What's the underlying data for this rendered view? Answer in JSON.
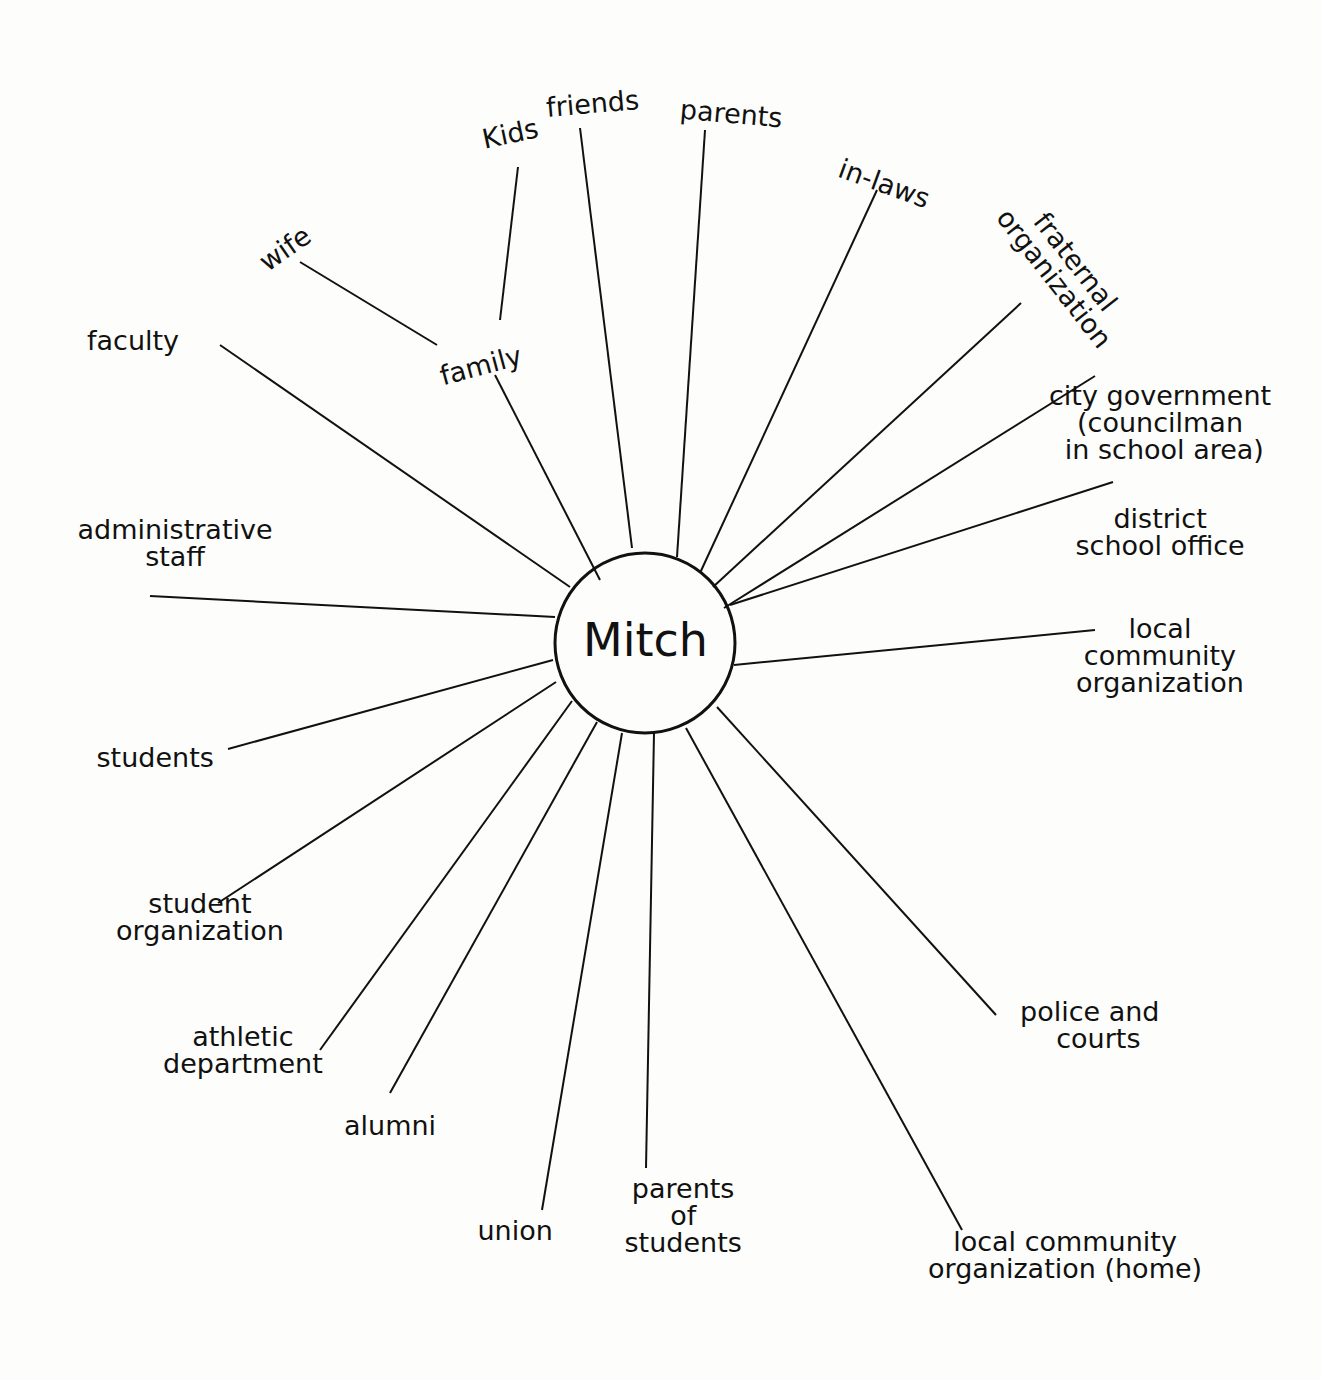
{
  "diagram": {
    "type": "network-star",
    "center": {
      "label": "Mitch",
      "cx": 645,
      "cy": 643,
      "r": 90
    },
    "branches": [
      {
        "id": "family",
        "label": "family",
        "x": 480,
        "y": 365,
        "rot": -15,
        "line": [
          495,
          375,
          600,
          580
        ]
      },
      {
        "id": "wife",
        "label": "wife",
        "x": 285,
        "y": 248,
        "rot": -35,
        "line": [
          300,
          262,
          437,
          345
        ],
        "parent": "family"
      },
      {
        "id": "kids",
        "label": "Kids",
        "x": 510,
        "y": 133,
        "rot": -12,
        "line": [
          518,
          167,
          500,
          320
        ],
        "parent": "family"
      },
      {
        "id": "friends",
        "label": "friends",
        "x": 592,
        "y": 103,
        "rot": -5,
        "line": [
          580,
          128,
          632,
          548
        ]
      },
      {
        "id": "parents",
        "label": "parents",
        "x": 731,
        "y": 113,
        "rot": 5,
        "line": [
          705,
          130,
          677,
          557
        ]
      },
      {
        "id": "in-laws",
        "label": "in-laws",
        "x": 884,
        "y": 183,
        "rot": 20,
        "line": [
          877,
          190,
          700,
          573
        ]
      },
      {
        "id": "fraternal",
        "label": "fraternal\norganization",
        "x": 1065,
        "y": 270,
        "rot": 52,
        "line": [
          1021,
          303,
          713,
          587
        ]
      },
      {
        "id": "city-gov",
        "label": "city government\n(councilman\n in school area)",
        "x": 1160,
        "y": 422,
        "rot": 0,
        "line": [
          1095,
          376,
          724,
          608
        ]
      },
      {
        "id": "district",
        "label": "district\nschool office",
        "x": 1160,
        "y": 532,
        "rot": 0,
        "line": [
          1113,
          482,
          730,
          605
        ]
      },
      {
        "id": "local-comm-school",
        "label": "local\ncommunity\norganization",
        "x": 1160,
        "y": 655,
        "rot": 0,
        "line": [
          1095,
          630,
          734,
          665
        ]
      },
      {
        "id": "faculty",
        "label": "faculty",
        "x": 133,
        "y": 340,
        "rot": 0,
        "line": [
          220,
          345,
          570,
          587
        ]
      },
      {
        "id": "admin",
        "label": "administrative\nstaff",
        "x": 175,
        "y": 543,
        "rot": 0,
        "line": [
          150,
          596,
          555,
          617
        ]
      },
      {
        "id": "students",
        "label": "students",
        "x": 155,
        "y": 757,
        "rot": 0,
        "line": [
          228,
          749,
          553,
          660
        ]
      },
      {
        "id": "student-org",
        "label": "student\norganization",
        "x": 200,
        "y": 917,
        "rot": 0,
        "line": [
          218,
          903,
          556,
          682
        ]
      },
      {
        "id": "athletic",
        "label": "athletic\ndepartment",
        "x": 243,
        "y": 1050,
        "rot": 0,
        "line": [
          320,
          1050,
          572,
          701
        ]
      },
      {
        "id": "alumni",
        "label": "alumni",
        "x": 390,
        "y": 1125,
        "rot": 0,
        "line": [
          390,
          1093,
          597,
          722
        ]
      },
      {
        "id": "union",
        "label": "union",
        "x": 515,
        "y": 1230,
        "rot": 0,
        "line": [
          542,
          1210,
          622,
          733
        ]
      },
      {
        "id": "parents-students",
        "label": "parents\nof\nstudents",
        "x": 683,
        "y": 1215,
        "rot": 0,
        "line": [
          646,
          1168,
          654,
          733
        ]
      },
      {
        "id": "police",
        "label": "police and\n  courts",
        "x": 1090,
        "y": 1025,
        "rot": 0,
        "line": [
          996,
          1015,
          717,
          707
        ]
      },
      {
        "id": "local-comm-home",
        "label": "local community\norganization (home)",
        "x": 1065,
        "y": 1255,
        "rot": 0,
        "line": [
          962,
          1230,
          686,
          728
        ]
      }
    ]
  },
  "colors": {
    "ink": "#111111",
    "paper": "#fdfdfb"
  }
}
